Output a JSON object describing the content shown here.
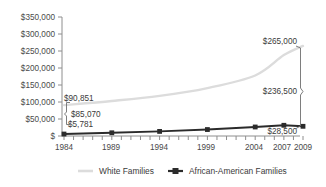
{
  "chart_data": {
    "type": "line",
    "title": "",
    "subtitle": "",
    "xlabel": "",
    "ylabel": "",
    "grid": false,
    "legend_position": "bottom",
    "x": [
      1984,
      1989,
      1994,
      1999,
      2004,
      2007,
      2009
    ],
    "xlim": [
      1984,
      2009
    ],
    "ylim": [
      0,
      350000
    ],
    "y_ticks": [
      0,
      50000,
      100000,
      150000,
      200000,
      250000,
      300000,
      350000
    ],
    "y_tick_labels": [
      "$",
      "$50,000",
      "$100,000",
      "$150,000",
      "$200,000",
      "$250,000",
      "$300,000",
      "$350,000"
    ],
    "x_tick_labels": [
      "1984",
      "1989",
      "1994",
      "1999",
      "2004",
      "2007",
      "2009"
    ],
    "x_minor_ticks_every": 1,
    "series": [
      {
        "name": "White Families",
        "color": "#dcdcdc",
        "marker": "none",
        "values": [
          90851,
          103000,
          118000,
          141000,
          178000,
          238000,
          265000
        ]
      },
      {
        "name": "African-American Families",
        "color": "#2b2b2b",
        "marker": "square",
        "values": [
          5781,
          9500,
          13500,
          19000,
          26500,
          31500,
          28500
        ]
      }
    ],
    "annotations": [
      {
        "name": "white-start-value",
        "text": "$90,851",
        "x": 1984,
        "y": 90851
      },
      {
        "name": "black-start-value",
        "text": "$5,781",
        "x": 1984,
        "y": 5781
      },
      {
        "name": "gap-1984-value",
        "text": "$85,070",
        "x": 1984,
        "y": 48000
      },
      {
        "name": "white-end-value",
        "text": "$265,000",
        "x": 2009,
        "y": 265000
      },
      {
        "name": "black-end-value",
        "text": "$28,500",
        "x": 2009,
        "y": 28500
      },
      {
        "name": "gap-2009-value",
        "text": "$236,500",
        "x": 2009,
        "y": 146000
      }
    ]
  }
}
